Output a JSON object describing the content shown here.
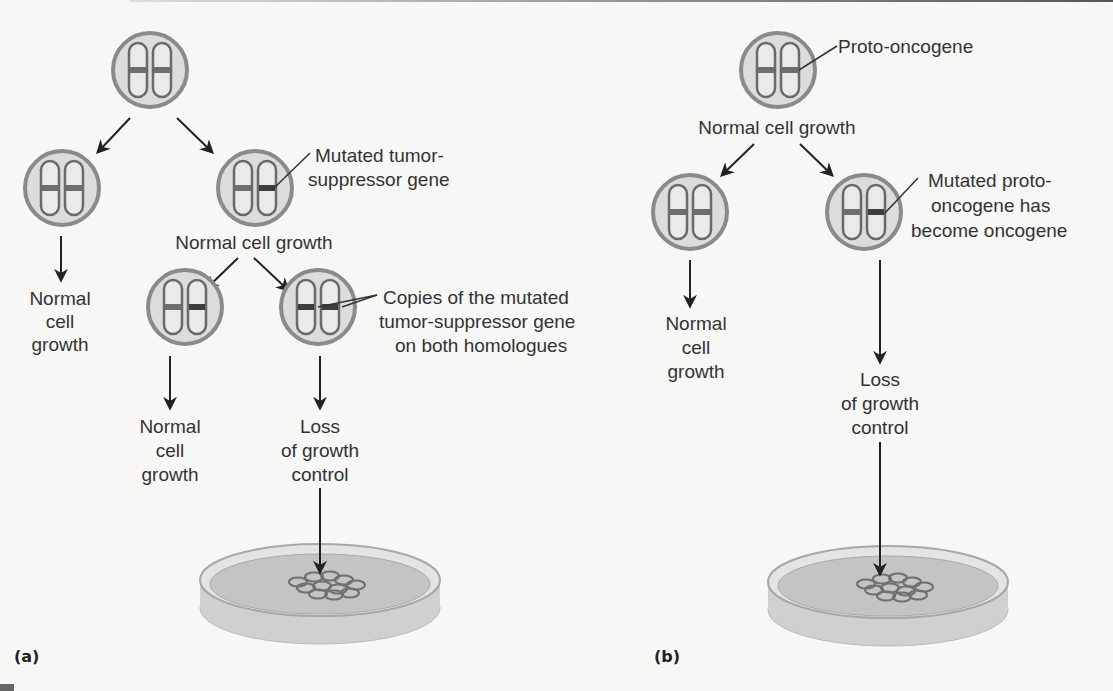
{
  "figure": {
    "panel_a": {
      "label": "(a)",
      "title": "Tumor-suppressor gene pathway",
      "nodes": {
        "top_cell": "normal cell",
        "row2_left_text": [
          "Normal",
          "cell",
          "growth"
        ],
        "row2_right_callout": [
          "Mutated tumor-",
          "suppressor gene"
        ],
        "row2_right_caption": "Normal cell growth",
        "row3_callout": [
          "Copies of the mutated",
          "tumor-suppressor gene",
          "on both homologues"
        ],
        "row3_left_text": [
          "Normal",
          "cell",
          "growth"
        ],
        "row3_right_text": [
          "Loss",
          "of growth",
          "control"
        ]
      }
    },
    "panel_b": {
      "label": "(b)",
      "title": "Proto-oncogene pathway",
      "nodes": {
        "top_callout": "Proto-oncogene",
        "top_caption": "Normal cell growth",
        "row2_right_callout": [
          "Mutated proto-",
          "oncogene has",
          "become oncogene"
        ],
        "row2_left_text": [
          "Normal",
          "cell",
          "growth"
        ],
        "row2_right_text": [
          "Loss",
          "of growth",
          "control"
        ]
      }
    },
    "colors": {
      "cell_fill": "#dcdcdc",
      "cell_ring": "#8a8a8a",
      "chromosome_outline": "#6a6a6a",
      "normal_band": "#6e6e6e",
      "mutated_band": "#4a4a4a",
      "arrow": "#222222",
      "text": "#333333"
    }
  }
}
